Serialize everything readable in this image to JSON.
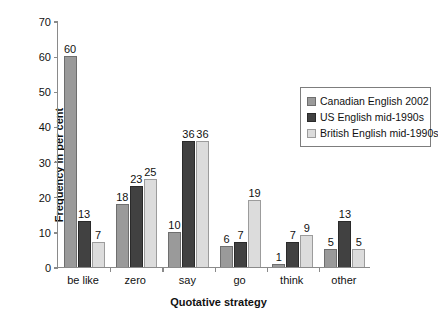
{
  "chart_data": {
    "type": "bar",
    "title": "",
    "xlabel": "Quotative strategy",
    "ylabel": "Frequency in per cent",
    "categories": [
      "be like",
      "zero",
      "say",
      "go",
      "think",
      "other"
    ],
    "series": [
      {
        "name": "Canadian English 2002",
        "color": "#9a9a9a",
        "values": [
          60,
          18,
          10,
          6,
          1,
          5
        ]
      },
      {
        "name": "US English mid-1990s",
        "color": "#414141",
        "values": [
          13,
          23,
          36,
          7,
          7,
          13
        ]
      },
      {
        "name": "British English mid-1990s",
        "color": "#dcdcdc",
        "values": [
          7,
          25,
          36,
          19,
          9,
          5
        ]
      }
    ],
    "ylim": [
      0,
      70
    ],
    "yticks": [
      0,
      10,
      20,
      30,
      40,
      50,
      60,
      70
    ],
    "ytick_labels": [
      "0",
      "10",
      "20",
      "30",
      "40",
      "50",
      "60",
      "70"
    ],
    "grid": false,
    "legend_position": "upper right",
    "data_labels": true
  },
  "legend": {
    "entries": [
      "Canadian English 2002",
      "US English mid-1990s",
      "British English mid-1990s"
    ]
  }
}
